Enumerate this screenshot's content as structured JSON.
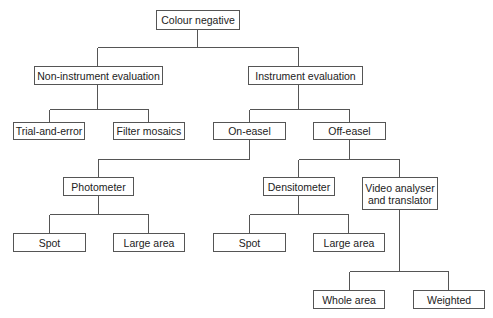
{
  "diagram": {
    "type": "tree",
    "line_color": "#555555",
    "nodes": {
      "root": "Colour negative",
      "non_instrument": "Non-instrument evaluation",
      "instrument": "Instrument evaluation",
      "trial_and_error": "Trial-and-error",
      "filter_mosaics": "Filter mosaics",
      "on_easel": "On-easel",
      "off_easel": "Off-easel",
      "photometer": "Photometer",
      "photometer_spot": "Spot",
      "photometer_large_area": "Large area",
      "densitometer": "Densitometer",
      "video_analyser": "Video analyser\nand translator",
      "densitometer_spot": "Spot",
      "densitometer_large_area": "Large area",
      "whole_area": "Whole area",
      "weighted": "Weighted"
    },
    "edges": [
      [
        "root",
        "non_instrument"
      ],
      [
        "root",
        "instrument"
      ],
      [
        "non_instrument",
        "trial_and_error"
      ],
      [
        "non_instrument",
        "filter_mosaics"
      ],
      [
        "instrument",
        "on_easel"
      ],
      [
        "instrument",
        "off_easel"
      ],
      [
        "on_easel",
        "photometer"
      ],
      [
        "photometer",
        "photometer_spot"
      ],
      [
        "photometer",
        "photometer_large_area"
      ],
      [
        "off_easel",
        "densitometer"
      ],
      [
        "off_easel",
        "video_analyser"
      ],
      [
        "densitometer",
        "densitometer_spot"
      ],
      [
        "densitometer",
        "densitometer_large_area"
      ],
      [
        "video_analyser",
        "whole_area"
      ],
      [
        "video_analyser",
        "weighted"
      ]
    ]
  }
}
